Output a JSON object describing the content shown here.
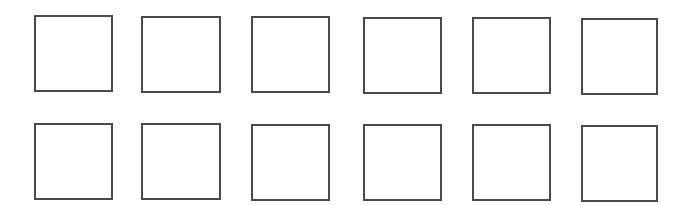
{
  "figure": {
    "background": "#ffffff",
    "stroke_color": "#4a4a4a",
    "stroke_width": 2,
    "rows": 2,
    "columns": 6,
    "squares": [
      {
        "row": 0,
        "col": 0,
        "x": 34,
        "y": 15,
        "w": 79,
        "h": 77
      },
      {
        "row": 0,
        "col": 1,
        "x": 141,
        "y": 16,
        "w": 80,
        "h": 77
      },
      {
        "row": 0,
        "col": 2,
        "x": 251,
        "y": 16,
        "w": 79,
        "h": 77
      },
      {
        "row": 0,
        "col": 3,
        "x": 363,
        "y": 17,
        "w": 79,
        "h": 77
      },
      {
        "row": 0,
        "col": 4,
        "x": 472,
        "y": 17,
        "w": 79,
        "h": 77
      },
      {
        "row": 0,
        "col": 5,
        "x": 581,
        "y": 18,
        "w": 77,
        "h": 77
      },
      {
        "row": 1,
        "col": 0,
        "x": 34,
        "y": 123,
        "w": 79,
        "h": 77
      },
      {
        "row": 1,
        "col": 1,
        "x": 141,
        "y": 123,
        "w": 80,
        "h": 77
      },
      {
        "row": 1,
        "col": 2,
        "x": 251,
        "y": 124,
        "w": 79,
        "h": 77
      },
      {
        "row": 1,
        "col": 3,
        "x": 363,
        "y": 124,
        "w": 79,
        "h": 77
      },
      {
        "row": 1,
        "col": 4,
        "x": 472,
        "y": 124,
        "w": 79,
        "h": 77
      },
      {
        "row": 1,
        "col": 5,
        "x": 581,
        "y": 125,
        "w": 77,
        "h": 77
      }
    ]
  }
}
